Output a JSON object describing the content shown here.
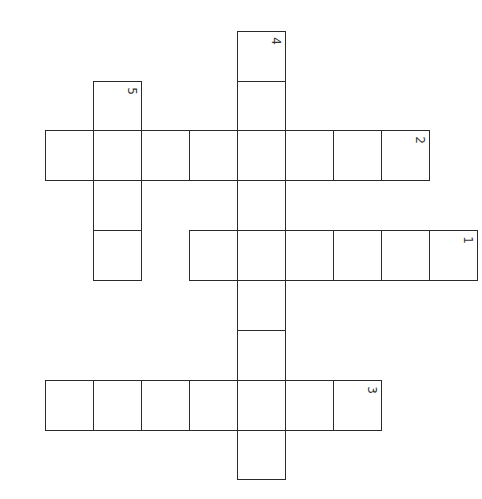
{
  "puzzle": {
    "type": "crossword",
    "orientation_note": "image rotated 90 degrees clockwise",
    "grid_origin": {
      "x": 45,
      "y": 31
    },
    "cell_size": {
      "w": 48,
      "h": 50
    },
    "entries": [
      {
        "number": "1",
        "direction": "row",
        "row": 4,
        "col_start": 3,
        "length": 6,
        "number_at_col": 8
      },
      {
        "number": "2",
        "direction": "row",
        "row": 2,
        "col_start": 0,
        "length": 8,
        "number_at_col": 7
      },
      {
        "number": "3",
        "direction": "row",
        "row": 7,
        "col_start": 0,
        "length": 7,
        "number_at_col": 6
      },
      {
        "number": "4",
        "direction": "col",
        "col": 4,
        "row_start": 0,
        "length": 9,
        "number_at_row": 0
      },
      {
        "number": "5",
        "direction": "col",
        "col": 1,
        "row_start": 1,
        "length": 4,
        "number_at_row": 1
      }
    ]
  },
  "colors": {
    "line": "#2a2a2a",
    "background": "#ffffff"
  }
}
